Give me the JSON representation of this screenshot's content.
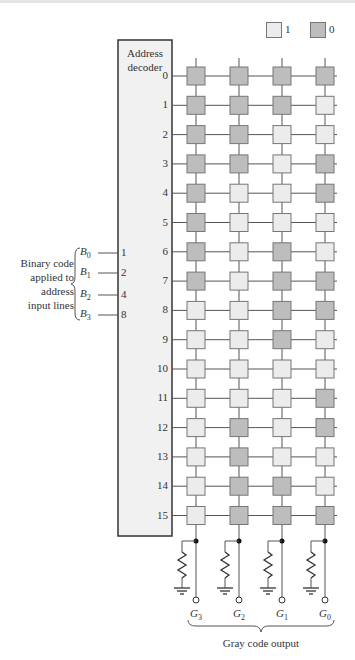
{
  "legend": {
    "items": [
      {
        "label": "1",
        "color": "#ececec"
      },
      {
        "label": "0",
        "color": "#bdbdbd"
      }
    ]
  },
  "decoder": {
    "title_line1": "Address",
    "title_line2": "decoder"
  },
  "rows": [
    "0",
    "1",
    "2",
    "3",
    "4",
    "5",
    "6",
    "7",
    "8",
    "9",
    "10",
    "11",
    "12",
    "13",
    "14",
    "15"
  ],
  "gray_bits": [
    "0000",
    "0001",
    "0011",
    "0010",
    "0110",
    "0111",
    "0101",
    "0100",
    "1100",
    "1101",
    "1111",
    "1110",
    "1010",
    "1011",
    "1001",
    "1000"
  ],
  "inputs": {
    "side_label_lines": [
      "Binary code",
      "applied to",
      "address",
      "input lines"
    ],
    "lines": [
      {
        "name": "B",
        "sub": "0",
        "weight": "1"
      },
      {
        "name": "B",
        "sub": "1",
        "weight": "2"
      },
      {
        "name": "B",
        "sub": "2",
        "weight": "4"
      },
      {
        "name": "B",
        "sub": "3",
        "weight": "8"
      }
    ]
  },
  "outputs": {
    "columns": [
      {
        "name": "G",
        "sub": "3"
      },
      {
        "name": "G",
        "sub": "2"
      },
      {
        "name": "G",
        "sub": "1"
      },
      {
        "name": "G",
        "sub": "0"
      }
    ],
    "caption": "Gray code output"
  },
  "colors": {
    "one": "#ececec",
    "zero": "#bdbdbd",
    "decoder_fill": "#f1f1f1",
    "line": "#555555"
  }
}
